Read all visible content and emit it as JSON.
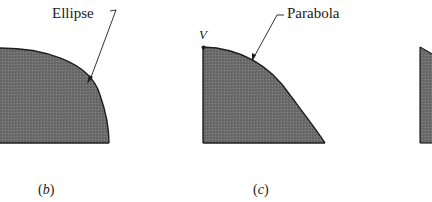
{
  "figure": {
    "panels": [
      {
        "id": "b",
        "caption_open": "(",
        "caption_letter": "b",
        "caption_close": ")",
        "curve_label": "Ellipse",
        "shape": "quarter-ellipse-region"
      },
      {
        "id": "c",
        "caption_open": "(",
        "caption_letter": "c",
        "caption_close": ")",
        "curve_label": "Parabola",
        "vertex_label": "V",
        "shape": "parabolic-spandrel-region"
      },
      {
        "id": "d",
        "shape": "partial-region-cropped"
      }
    ],
    "colors": {
      "fill": "#6e6e6e",
      "outline": "#1e1e1e",
      "leader": "#333333",
      "text": "#1a1a1a",
      "background": "#ffffff"
    }
  }
}
